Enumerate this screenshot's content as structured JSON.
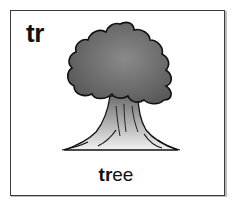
{
  "card": {
    "blend_letters": "tr",
    "word_prefix": "tr",
    "word_rest": "ee",
    "image": "tree-illustration"
  }
}
